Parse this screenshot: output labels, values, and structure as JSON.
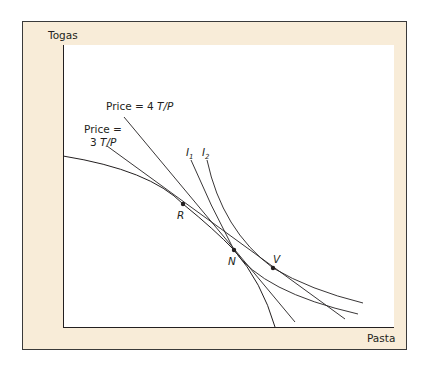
{
  "figure": {
    "y_axis_label": "Togas",
    "x_axis_label": "Pasta",
    "colors": {
      "frame_background": "#f8ecd8",
      "frame_border": "#3a3a3a",
      "plot_background": "#ffffff",
      "curve": "#231f20"
    },
    "lines": {
      "price4": {
        "prefix": "Price = 4 ",
        "unit": "T/P"
      },
      "price3": {
        "line1": "Price =",
        "line2_prefix": "3 ",
        "unit": "T/P"
      }
    },
    "indifference_curves": {
      "i1": {
        "letter": "I",
        "subscript": "1"
      },
      "i2": {
        "letter": "I",
        "subscript": "2"
      }
    },
    "points": {
      "R": "R",
      "N": "N",
      "V": "V"
    }
  }
}
